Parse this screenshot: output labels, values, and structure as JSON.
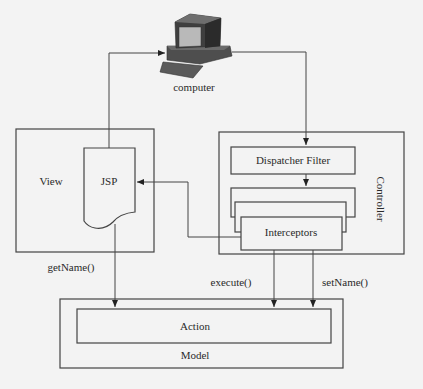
{
  "diagram": {
    "title": "",
    "nodes": {
      "computer": {
        "label": "computer",
        "icon": "computer-icon"
      },
      "view": {
        "label": "View"
      },
      "jsp": {
        "label": "JSP"
      },
      "controller": {
        "label": "Controller"
      },
      "dispatcher_filter": {
        "label": "Dispatcher Filter"
      },
      "interceptors": {
        "label": "Interceptors"
      },
      "model": {
        "label": "Model"
      },
      "action": {
        "label": "Action"
      }
    },
    "edges": [
      {
        "from": "jsp",
        "to": "computer",
        "label": ""
      },
      {
        "from": "computer",
        "to": "dispatcher_filter",
        "label": ""
      },
      {
        "from": "dispatcher_filter",
        "to": "interceptors",
        "label": ""
      },
      {
        "from": "interceptors",
        "to": "jsp",
        "label": ""
      },
      {
        "from": "jsp",
        "to": "action",
        "label": "getName()"
      },
      {
        "from": "interceptors",
        "to": "action",
        "label": "execute()"
      },
      {
        "from": "interceptors",
        "to": "action",
        "label": "setName()"
      }
    ],
    "edge_labels": {
      "get_name": "getName()",
      "execute": "execute()",
      "set_name": "setName()"
    },
    "colors": {
      "background": "#f3f3f3",
      "stroke": "#444444",
      "computer_body": "#555555",
      "computer_screen": "#b9b9b9"
    }
  }
}
